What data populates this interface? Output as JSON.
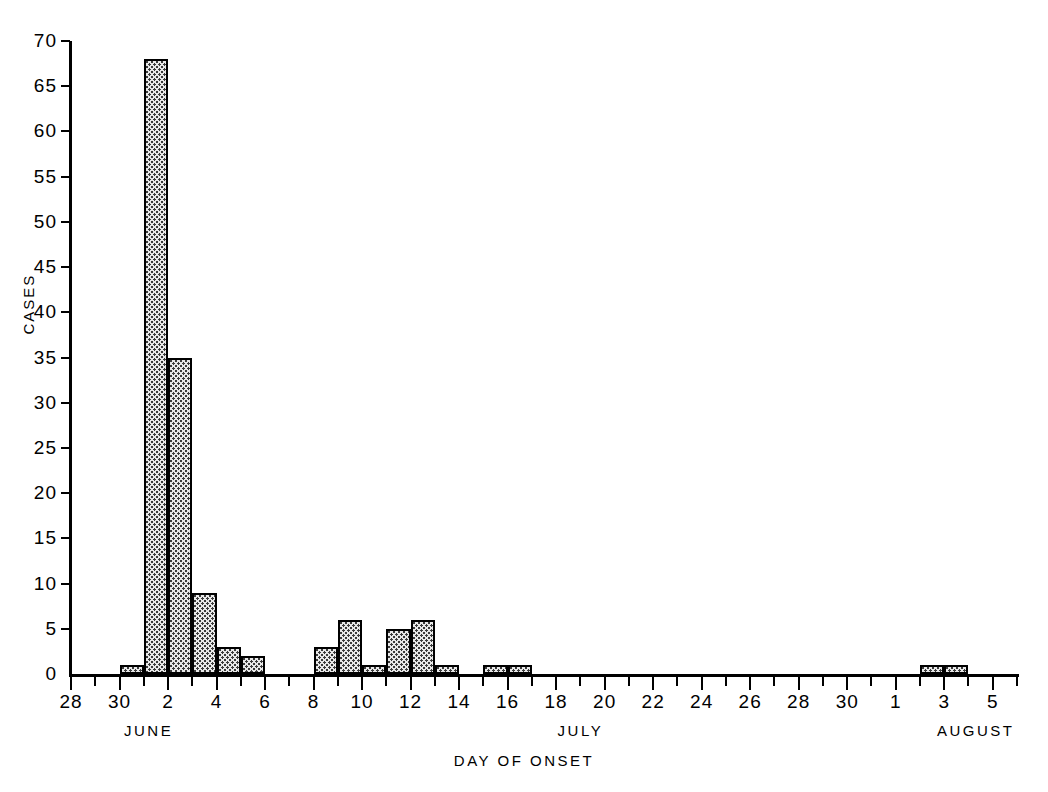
{
  "chart_data": {
    "type": "bar",
    "title": "",
    "subtitle": "",
    "xlabel": "DAY OF ONSET",
    "ylabel": "CASES",
    "ylim": [
      0,
      70
    ],
    "ytick_step": 5,
    "grid": false,
    "legend": null,
    "annotations": [],
    "y_ticks": [
      0,
      5,
      10,
      15,
      20,
      25,
      30,
      35,
      40,
      45,
      50,
      55,
      60,
      65,
      70
    ],
    "x_tick_labels": [
      "28",
      "30",
      "2",
      "4",
      "6",
      "8",
      "10",
      "12",
      "14",
      "16",
      "18",
      "20",
      "22",
      "24",
      "26",
      "28",
      "30",
      "1",
      "3",
      "5"
    ],
    "x_axis_start_label": "28",
    "x_axis_end_label": "5",
    "month_groups": [
      {
        "name": "JUNE",
        "label": "JUNE"
      },
      {
        "name": "JULY",
        "label": "JULY"
      },
      {
        "name": "AUGUST",
        "label": "AUGUST"
      }
    ],
    "categories": [
      "JUN 28",
      "JUN 29",
      "JUN 30",
      "JUL 1",
      "JUL 2",
      "JUL 3",
      "JUL 4",
      "JUL 5",
      "JUL 6",
      "JUL 7",
      "JUL 8",
      "JUL 9",
      "JUL 10",
      "JUL 11",
      "JUL 12",
      "JUL 13",
      "JUL 14",
      "JUL 15",
      "JUL 16",
      "JUL 17",
      "JUL 18",
      "JUL 19",
      "JUL 20",
      "JUL 21",
      "JUL 22",
      "JUL 23",
      "JUL 24",
      "JUL 25",
      "JUL 26",
      "JUL 27",
      "JUL 28",
      "JUL 29",
      "JUL 30",
      "JUL 31",
      "AUG 1",
      "AUG 2",
      "AUG 3",
      "AUG 4",
      "AUG 5"
    ],
    "values": [
      0,
      0,
      1,
      68,
      35,
      9,
      3,
      2,
      0,
      0,
      3,
      6,
      1,
      5,
      6,
      1,
      0,
      1,
      1,
      0,
      0,
      0,
      0,
      0,
      0,
      0,
      0,
      0,
      0,
      0,
      0,
      0,
      0,
      0,
      0,
      1,
      1,
      0,
      0
    ],
    "bar_fill": "#e8e8e8",
    "bar_edge": "#000000",
    "bar_pattern": "stipple-dots",
    "axis_color": "#000000",
    "background": "#ffffff",
    "peak": {
      "category": "JUL 2",
      "value": 68
    },
    "total_cases": 144
  },
  "icons": {
    "none": ""
  }
}
